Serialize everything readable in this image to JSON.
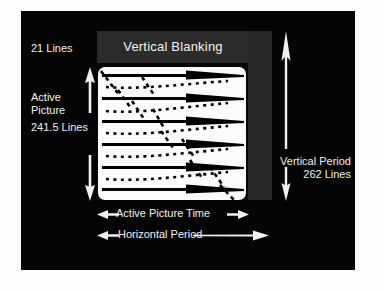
{
  "figure": {
    "type": "diagram",
    "background_color": "#050505",
    "page_color": "#ffffff",
    "text_color": "#f0f0f0",
    "blanking_band_color": "#2b2b2b",
    "right_band_color": "#262626",
    "picture_color": "#fbfbfb",
    "scan_line_color": "#000000"
  },
  "labels": {
    "vertical_blanking": "Vertical Blanking",
    "lines_21": "21 Lines",
    "active_picture_line1": "Active",
    "active_picture_line2": "Picture",
    "active_picture_lines": "241.5 Lines",
    "vertical_period_line1": "Vertical Period",
    "vertical_period_line2": "262 Lines",
    "active_picture_time": "Active Picture Time",
    "horizontal_period": "Horizontal Period"
  },
  "measurements": {
    "vertical_blanking_lines": "21 Lines",
    "active_picture_lines": "241.5 Lines",
    "vertical_period_lines": "262 Lines"
  },
  "raster": {
    "visible_scan_lines": 6,
    "retrace_lines": 6,
    "scan_line_style": "solid tapered wedge",
    "retrace_line_style": "dotted diagonal"
  },
  "arrows": {
    "active_picture": "double-headed vertical arrow",
    "vertical_period": "double-headed vertical arrow",
    "active_picture_time": "double-headed horizontal arrow",
    "horizontal_period": "double-headed horizontal arrow"
  }
}
